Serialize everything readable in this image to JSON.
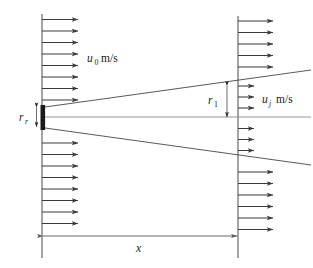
{
  "diagram": {
    "labels": {
      "inlet_velocity_symbol": "u",
      "inlet_velocity_subscript": "0",
      "inlet_velocity_units": "m/s",
      "jet_velocity_symbol": "u",
      "jet_velocity_subscript": "j",
      "jet_velocity_units": "m/s",
      "nozzle_radius_symbol": "r",
      "nozzle_radius_subscript": "r",
      "jet_radius_symbol": "r",
      "jet_radius_subscript": "1",
      "distance_symbol": "x"
    },
    "colors": {
      "line": "#5a5a5a",
      "arrow": "#3b3b3b",
      "centerline": "#8a8a8a",
      "nozzle": "#1a1a1a",
      "background": "#ffffff"
    },
    "geometry": {
      "left_plane_x": 42,
      "right_plane_x": 238,
      "centerline_y": 117,
      "left_plane_top_y": 14,
      "left_plane_bottom_y": 258,
      "right_plane_top_y": 16,
      "right_plane_bottom_y": 258,
      "nozzle_top_y": 105,
      "nozzle_bottom_y": 130,
      "jet_half_width_at_right": 46,
      "dimension_line_y": 236
    },
    "arrows": {
      "left_outer_tip_x": 82,
      "right_outer_tip_x": 277,
      "right_inner_tip_x": 258,
      "spacing": 11.5
    }
  }
}
